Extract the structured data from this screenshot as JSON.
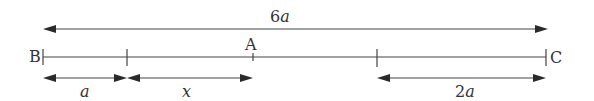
{
  "diagram": {
    "type": "line-segment-with-dimensions",
    "points": [
      {
        "id": "B",
        "label": "B",
        "position_units_a": 0
      },
      {
        "id": "A",
        "label": "A",
        "position_desc": "a + x from B"
      },
      {
        "id": "C",
        "label": "C",
        "position_units_a": 6
      }
    ],
    "tick_marks": [
      "B",
      "a from B",
      "A",
      "2a before C",
      "C"
    ],
    "dimensions": [
      {
        "id": "total",
        "label_coeff": "6",
        "label_var": "a",
        "from": "B",
        "to": "C"
      },
      {
        "id": "seg_a",
        "label_coeff": "",
        "label_var": "a",
        "from": "B",
        "to": "tick at a"
      },
      {
        "id": "seg_x",
        "label_coeff": "",
        "label_var": "x",
        "from": "tick at a",
        "to": "A"
      },
      {
        "id": "seg_2a",
        "label_coeff": "2",
        "label_var": "a",
        "from": "tick at 4a",
        "to": "C"
      }
    ],
    "colors": {
      "line": "#444444",
      "text": "#333333",
      "background": "#ffffff"
    }
  }
}
